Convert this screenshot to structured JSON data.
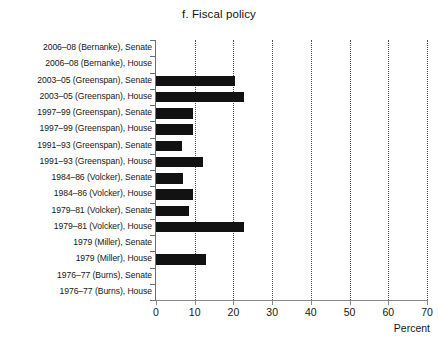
{
  "chart_data": {
    "type": "bar",
    "orientation": "horizontal",
    "title": "f. Fiscal policy",
    "xlabel": "Percent",
    "ylabel": "",
    "xlim": [
      0,
      70
    ],
    "xticks": [
      0,
      10,
      20,
      30,
      40,
      50,
      60,
      70
    ],
    "xtick_labels": [
      "0",
      "10",
      "20",
      "30",
      "40",
      "50",
      "60",
      "70"
    ],
    "grid": "vertical-dotted",
    "legend": "none",
    "bar_color": "#121212",
    "categories": [
      "2006–08 (Bernanke), Senate",
      "2006–08 (Bernanke), House",
      "2003–05 (Greenspan), Senate",
      "2003–05 (Greenspan), House",
      "1997–99 (Greenspan), Senate",
      "1997–99 (Greenspan), House",
      "1991–93 (Greenspan), Senate",
      "1991–93 (Greenspan), House",
      "1984–86 (Volcker), Senate",
      "1984–86 (Volcker), House",
      "1979–81 (Volcker), Senate",
      "1979–81 (Volcker), House",
      "1979 (Miller), Senate",
      "1979 (Miller), House",
      "1976–77 (Burns), Senate",
      "1976–77 (Burns), House"
    ],
    "values": [
      0,
      0,
      20.5,
      22.7,
      9.6,
      9.6,
      6.7,
      12.1,
      7.0,
      9.6,
      8.6,
      22.7,
      0,
      12.9,
      0,
      0
    ]
  }
}
